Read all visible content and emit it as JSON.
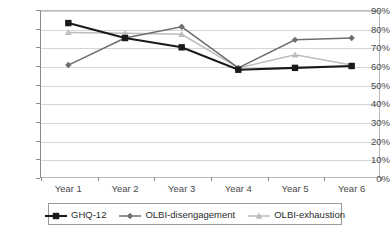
{
  "chart_data": {
    "type": "line",
    "title": "",
    "xlabel": "",
    "ylabel": "",
    "categories": [
      "Year 1",
      "Year 2",
      "Year 3",
      "Year 4",
      "Year 5",
      "Year 6"
    ],
    "ylim": [
      0,
      90
    ],
    "ytick_labels": [
      "0%",
      "10%",
      "20%",
      "30%",
      "40%",
      "50%",
      "60%",
      "70%",
      "80%",
      "90%"
    ],
    "ytick_values": [
      0,
      10,
      20,
      30,
      40,
      50,
      60,
      70,
      80,
      90
    ],
    "grid": true,
    "legend_position": "bottom",
    "series": [
      {
        "name": "GHQ-12",
        "color": "#1a1a1a",
        "marker": "square",
        "values": [
          83,
          75,
          70,
          58,
          59,
          60
        ]
      },
      {
        "name": "OLBI-disengagement",
        "color": "#6e6e6e",
        "marker": "diamond",
        "values": [
          60.5,
          75,
          81,
          59,
          74,
          75
        ]
      },
      {
        "name": "OLBI-exhaustion",
        "color": "#bdbdbd",
        "marker": "triangle",
        "values": [
          78,
          77.5,
          77,
          59,
          66,
          60.5
        ]
      }
    ]
  },
  "legend": {
    "items": [
      {
        "label": "GHQ-12"
      },
      {
        "label": "OLBI-disengagement"
      },
      {
        "label": "OLBI-exhaustion"
      }
    ]
  },
  "axis": {
    "y_labels": [
      "90%",
      "80%",
      "70%",
      "60%",
      "50%",
      "40%",
      "30%",
      "20%",
      "10%",
      "0%"
    ],
    "x_labels": [
      "Year 1",
      "Year 2",
      "Year 3",
      "Year 4",
      "Year 5",
      "Year 6"
    ]
  },
  "colors": {
    "series_1": "#1a1a1a",
    "series_2": "#6e6e6e",
    "series_3": "#bdbdbd",
    "grid": "#d5d5d5",
    "axis": "#8a8a8a",
    "text": "#4a4a4a"
  }
}
